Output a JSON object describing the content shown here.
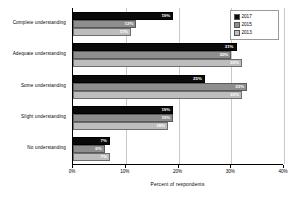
{
  "chart_data": {
    "type": "bar",
    "orientation": "horizontal",
    "title": "",
    "xlabel": "Percent of respondents",
    "ylabel": "",
    "xlim": [
      0,
      40
    ],
    "xticks": [
      "0%",
      "10%",
      "20%",
      "30%",
      "40%"
    ],
    "xtick_values": [
      0,
      10,
      20,
      30,
      40
    ],
    "grid": true,
    "grid_axis": "x",
    "legend_position": "top-right",
    "categories": [
      "Complete understanding",
      "Adequate understanding",
      "Some understanding",
      "Slight understanding",
      "No understanding"
    ],
    "series": [
      {
        "name": "2017",
        "color": "#0a0a0a",
        "values": [
          19,
          31,
          25,
          19,
          7
        ],
        "labels": [
          "19%",
          "31%",
          "25%",
          "19%",
          "7%"
        ]
      },
      {
        "name": "2015",
        "color": "#8e8e8e",
        "values": [
          12,
          30,
          33,
          19,
          6
        ],
        "labels": [
          "12%",
          "30%",
          "33%",
          "19%",
          "6%"
        ]
      },
      {
        "name": "2013",
        "color": "#bdbdbd",
        "values": [
          11,
          32,
          32,
          18,
          7
        ],
        "labels": [
          "11%",
          "32%",
          "32%",
          "18%",
          "7%"
        ]
      }
    ]
  },
  "legend": {
    "items": [
      {
        "label": "2017",
        "color": "#0a0a0a"
      },
      {
        "label": "2015",
        "color": "#8e8e8e"
      },
      {
        "label": "2013",
        "color": "#bdbdbd"
      }
    ]
  },
  "axis": {
    "x_title": "Percent of respondents"
  }
}
